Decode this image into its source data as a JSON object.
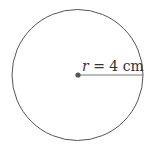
{
  "diagram": {
    "type": "circle",
    "circle": {
      "cx": 77.5,
      "cy": 75,
      "r": 65.5,
      "stroke": "#555555",
      "fill": "#ffffff"
    },
    "center_point": {
      "cx": 78,
      "cy": 75,
      "r": 2.6,
      "fill": "#555555"
    },
    "radius_line": {
      "x1": 78,
      "y1": 75,
      "x2": 143,
      "y2": 75,
      "stroke": "#777777"
    },
    "label": {
      "variable": "r",
      "equals": " = ",
      "value": "4 cm",
      "text": "r = 4 cm"
    }
  }
}
